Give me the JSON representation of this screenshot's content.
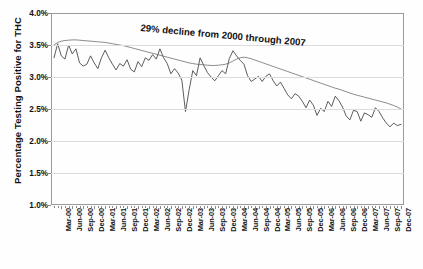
{
  "chart_data": {
    "type": "line",
    "title": "",
    "xlabel": "",
    "ylabel": "Percentage Testing Positive for THC",
    "ylim": [
      1.0,
      4.0
    ],
    "ytick_labels": [
      "4.0%",
      "3.5%",
      "3.0%",
      "2.5%",
      "2.0%",
      "1.5%",
      "1.0%"
    ],
    "ytick_values": [
      4.0,
      3.5,
      3.0,
      2.5,
      2.0,
      1.5,
      1.0
    ],
    "grid": true,
    "legend": "none",
    "annotations": [
      {
        "text": "29% decline from 2000 through 2007",
        "rotation_deg": 5.2
      }
    ],
    "xtick_labels": [
      "Mar-00",
      "Jun-00",
      "Sep-00",
      "Dec-00",
      "Mar-01",
      "Jun-01",
      "Sep-01",
      "Dec-01",
      "Mar-02",
      "Jun-02",
      "Sep-02",
      "Dec-02",
      "Mar-03",
      "Jun-03",
      "Sep-03",
      "Dec-03",
      "Mar-04",
      "Jun-04",
      "Sep-04",
      "Dec-04",
      "Mar-05",
      "Jun-05",
      "Sep-05",
      "Dec-05",
      "Mar-06",
      "Jun-06",
      "Sep-06",
      "Dec-06",
      "Mar-07",
      "Jun-07",
      "Sep-07",
      "Dec-07"
    ],
    "series": [
      {
        "name": "Monthly percentage testing positive for THC",
        "color": "#4a4a4a",
        "values": [
          3.3,
          3.52,
          3.33,
          3.28,
          3.5,
          3.36,
          3.44,
          3.22,
          3.17,
          3.2,
          3.33,
          3.22,
          3.13,
          3.3,
          3.42,
          3.3,
          3.2,
          3.11,
          3.21,
          3.17,
          3.27,
          3.12,
          3.08,
          3.24,
          3.16,
          3.3,
          3.26,
          3.35,
          3.28,
          3.44,
          3.3,
          3.21,
          3.05,
          3.13,
          3.06,
          2.95,
          2.46,
          2.8,
          3.1,
          3.02,
          3.3,
          3.18,
          3.07,
          3.0,
          2.94,
          3.02,
          3.1,
          3.05,
          3.29,
          3.41,
          3.33,
          3.26,
          3.2,
          3.02,
          2.93,
          2.97,
          3.01,
          2.93,
          3.01,
          3.05,
          2.94,
          2.86,
          2.92,
          2.82,
          2.72,
          2.66,
          2.74,
          2.7,
          2.62,
          2.52,
          2.64,
          2.56,
          2.4,
          2.51,
          2.46,
          2.62,
          2.54,
          2.7,
          2.63,
          2.53,
          2.39,
          2.33,
          2.48,
          2.46,
          2.31,
          2.44,
          2.41,
          2.37,
          2.52,
          2.46,
          2.36,
          2.28,
          2.22,
          2.28,
          2.24,
          2.26
        ]
      },
      {
        "name": "Smoothed trend line",
        "color": "#6d6d6d",
        "values": [
          3.5,
          3.54,
          3.56,
          3.57,
          3.575,
          3.58,
          3.58,
          3.575,
          3.57,
          3.565,
          3.56,
          3.555,
          3.55,
          3.545,
          3.54,
          3.53,
          3.52,
          3.51,
          3.5,
          3.49,
          3.475,
          3.46,
          3.445,
          3.43,
          3.415,
          3.4,
          3.385,
          3.37,
          3.355,
          3.34,
          3.325,
          3.31,
          3.295,
          3.28,
          3.265,
          3.25,
          3.235,
          3.22,
          3.21,
          3.2,
          3.195,
          3.19,
          3.185,
          3.18,
          3.18,
          3.185,
          3.19,
          3.2,
          3.22,
          3.25,
          3.28,
          3.3,
          3.31,
          3.3,
          3.285,
          3.265,
          3.245,
          3.225,
          3.205,
          3.185,
          3.165,
          3.145,
          3.125,
          3.105,
          3.085,
          3.065,
          3.045,
          3.025,
          3.005,
          2.985,
          2.965,
          2.945,
          2.925,
          2.905,
          2.885,
          2.865,
          2.845,
          2.825,
          2.81,
          2.79,
          2.77,
          2.75,
          2.73,
          2.715,
          2.7,
          2.685,
          2.67,
          2.655,
          2.64,
          2.625,
          2.61,
          2.595,
          2.575,
          2.555,
          2.53,
          2.5
        ]
      }
    ]
  }
}
